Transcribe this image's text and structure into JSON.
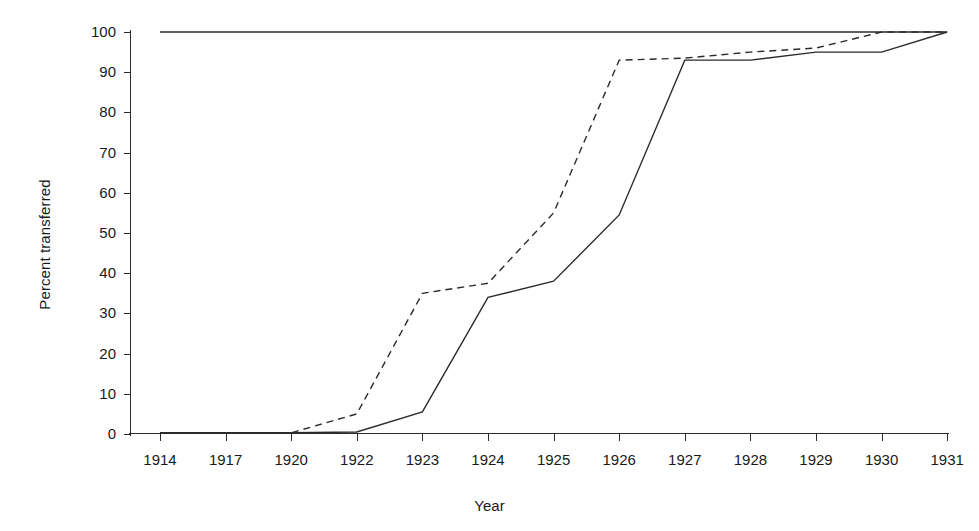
{
  "chart_data": {
    "type": "line",
    "title": "",
    "xlabel": "Year",
    "ylabel": "Percent transferred",
    "categories": [
      "1914",
      "1917",
      "1920",
      "1922",
      "1923",
      "1924",
      "1925",
      "1926",
      "1927",
      "1928",
      "1929",
      "1930",
      "1931"
    ],
    "ylim": [
      0,
      100
    ],
    "yticks": [
      0,
      10,
      20,
      30,
      40,
      50,
      60,
      70,
      80,
      90,
      100
    ],
    "grid": false,
    "legend": "none",
    "series": [
      {
        "name": "series-reference-100",
        "style": "solid",
        "values": [
          100,
          100,
          100,
          100,
          100,
          100,
          100,
          100,
          100,
          100,
          100,
          100,
          100
        ]
      },
      {
        "name": "series-dashed",
        "style": "dashed",
        "values": [
          0.3,
          0.3,
          0.3,
          5,
          35,
          37.5,
          55,
          93,
          93.5,
          95,
          96,
          100,
          100
        ]
      },
      {
        "name": "series-solid",
        "style": "solid",
        "values": [
          0.3,
          0.3,
          0.3,
          0.5,
          5.5,
          34,
          38,
          54.5,
          93,
          93,
          95,
          95,
          100
        ]
      }
    ]
  },
  "axis": {
    "y_tick_labels": [
      "0",
      "10",
      "20",
      "30",
      "40",
      "50",
      "60",
      "70",
      "80",
      "90",
      "100"
    ],
    "x_tick_labels": [
      "1914",
      "1917",
      "1920",
      "1922",
      "1923",
      "1924",
      "1925",
      "1926",
      "1927",
      "1928",
      "1929",
      "1930",
      "1931"
    ]
  },
  "labels": {
    "y_axis_title": "Percent transferred",
    "x_axis_title": "Year"
  },
  "colors": {
    "ink": "#2b2b2b",
    "background": "#ffffff"
  }
}
